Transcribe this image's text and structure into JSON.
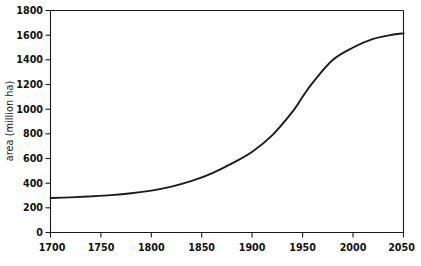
{
  "chart_data": {
    "type": "line",
    "title": "",
    "subtitle": "",
    "xlabel": "",
    "ylabel": "area (million ha)",
    "xlim": [
      1700,
      2050
    ],
    "ylim": [
      0,
      1800
    ],
    "grid": false,
    "legend": false,
    "legend_position": "none",
    "xticks": [
      1700,
      1750,
      1800,
      1850,
      1900,
      1950,
      2000,
      2050
    ],
    "xtick_labels": [
      "1700",
      "1750",
      "1800",
      "1850",
      "1900",
      "1950",
      "2000",
      "2050"
    ],
    "yticks": [
      0,
      200,
      400,
      600,
      800,
      1000,
      1200,
      1400,
      1600,
      1800
    ],
    "ytick_labels": [
      "0",
      "200",
      "400",
      "600",
      "800",
      "1000",
      "1200",
      "1400",
      "1600",
      "1800"
    ],
    "series": [
      {
        "name": "cropland area",
        "color": "#1b1b1b",
        "x": [
          1700,
          1720,
          1740,
          1760,
          1780,
          1800,
          1820,
          1840,
          1860,
          1880,
          1900,
          1920,
          1940,
          1950,
          1960,
          1980,
          2000,
          2020,
          2040,
          2050
        ],
        "values": [
          280,
          285,
          293,
          303,
          318,
          340,
          372,
          418,
          480,
          560,
          655,
          790,
          980,
          1100,
          1215,
          1400,
          1500,
          1570,
          1605,
          1615
        ]
      }
    ],
    "annotations": []
  },
  "axis": {
    "y_title": "area (million ha)"
  }
}
